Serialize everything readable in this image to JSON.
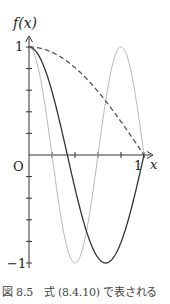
{
  "chart_data": {
    "type": "line",
    "title": "",
    "xlabel": "x",
    "ylabel": "f(x)",
    "xlim": [
      0,
      1
    ],
    "ylim": [
      -1,
      1
    ],
    "x_tick_labels": [
      "O",
      "1"
    ],
    "x_ticks": [
      0,
      0.2,
      0.4,
      0.6,
      0.8,
      1.0
    ],
    "y_tick_labels": [
      "1",
      "−1"
    ],
    "y_ticks": [
      -1,
      -0.8,
      -0.6,
      -0.4,
      -0.2,
      0,
      0.2,
      0.4,
      0.6,
      0.8,
      1
    ],
    "grid": false,
    "legend": null,
    "series": [
      {
        "name": "cos(πx/2)",
        "style": "dashed",
        "color": "#555555",
        "k": 0.5,
        "x": [
          0,
          0.2,
          0.4,
          0.6,
          0.8,
          1.0
        ],
        "y": [
          1.0,
          0.951,
          0.809,
          0.588,
          0.309,
          0.0
        ]
      },
      {
        "name": "cos(3πx/2)",
        "style": "solid",
        "color": "#333333",
        "k": 1.5,
        "x": [
          0,
          0.2,
          0.333,
          0.4,
          0.6,
          0.667,
          0.8,
          1.0
        ],
        "y": [
          1.0,
          0.588,
          0.0,
          -0.309,
          -0.951,
          -1.0,
          -0.809,
          0.0
        ]
      },
      {
        "name": "cos(5πx/2)",
        "style": "solid",
        "color": "#b8b8b8",
        "k": 2.5,
        "x": [
          0,
          0.1,
          0.2,
          0.3,
          0.4,
          0.5,
          0.6,
          0.7,
          0.8,
          0.9,
          1.0
        ],
        "y": [
          1.0,
          0.707,
          0.0,
          -0.707,
          -1.0,
          -0.707,
          0.0,
          0.707,
          1.0,
          0.707,
          0.0
        ]
      }
    ]
  },
  "labels": {
    "y_axis": "f(x)",
    "x_axis": "x",
    "origin": "O",
    "x_one": "1",
    "y_one": "1",
    "y_minus_one": "−1"
  },
  "caption": "図 8.5　式 (8.4.10) で表される"
}
